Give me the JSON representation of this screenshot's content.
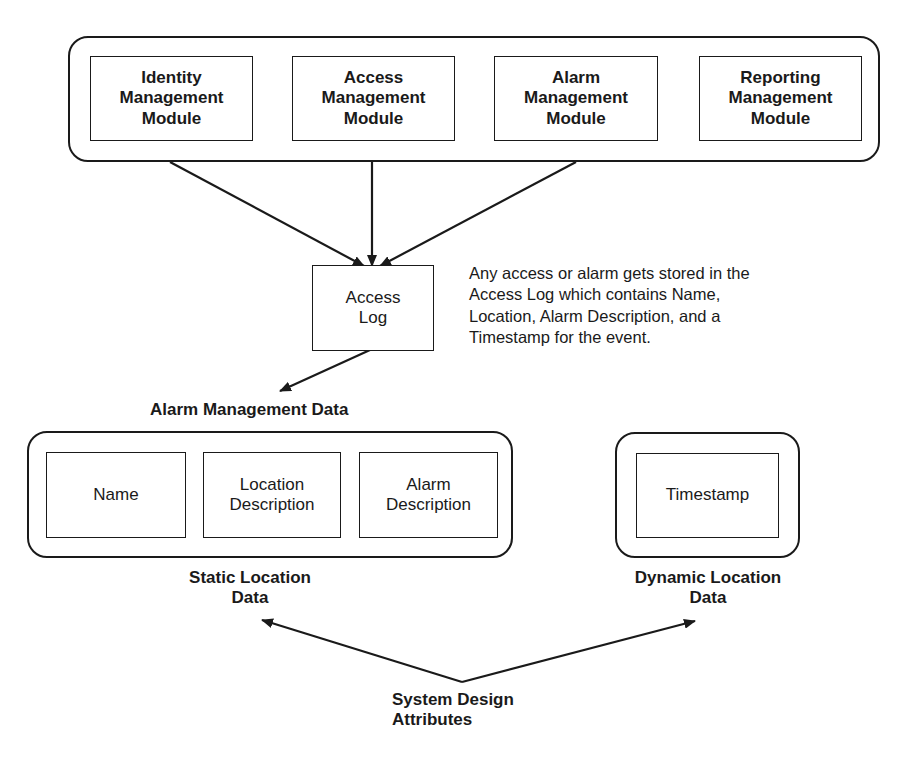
{
  "modules_group": {
    "modules": [
      {
        "label": "Identity\nManagement\nModule"
      },
      {
        "label": "Access\nManagement\nModule"
      },
      {
        "label": "Alarm\nManagement\nModule"
      },
      {
        "label": "Reporting\nManagement\nModule"
      }
    ]
  },
  "access_log": {
    "label": "Access\nLog"
  },
  "note": {
    "text": "Any access or alarm gets stored in the\nAccess Log which contains Name,\nLocation, Alarm Description, and a\nTimestamp for the event."
  },
  "alarm_data": {
    "title": "Alarm Management Data",
    "static_group": {
      "fields": [
        {
          "label": "Name"
        },
        {
          "label": "Location\nDescription"
        },
        {
          "label": "Alarm\nDescription"
        }
      ],
      "caption": "Static Location\nData"
    },
    "dynamic_group": {
      "fields": [
        {
          "label": "Timestamp"
        }
      ],
      "caption": "Dynamic Location\nData"
    }
  },
  "system_design": {
    "label": "System Design\nAttributes"
  },
  "colors": {
    "stroke": "#1a1a1a",
    "background": "#ffffff"
  }
}
